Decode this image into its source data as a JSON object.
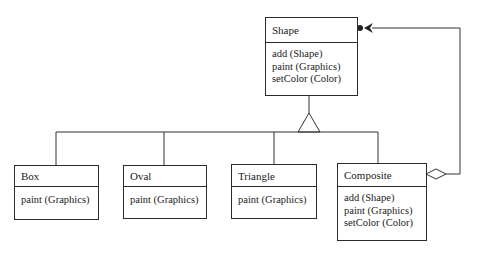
{
  "diagram": {
    "type": "UML class diagram (Composite pattern)",
    "classes": [
      {
        "id": "shape",
        "name": "Shape",
        "operations": [
          "add (Shape)",
          "paint (Graphics)",
          "setColor (Color)"
        ]
      },
      {
        "id": "box",
        "name": "Box",
        "operations": [
          "paint (Graphics)"
        ]
      },
      {
        "id": "oval",
        "name": "Oval",
        "operations": [
          "paint (Graphics)"
        ]
      },
      {
        "id": "triangle",
        "name": "Triangle",
        "operations": [
          "paint (Graphics)"
        ]
      },
      {
        "id": "composite",
        "name": "Composite",
        "operations": [
          "add (Shape)",
          "paint (Graphics)",
          "setColor (Color)"
        ]
      }
    ],
    "relationships": [
      {
        "type": "generalization",
        "from": "box",
        "to": "shape"
      },
      {
        "type": "generalization",
        "from": "oval",
        "to": "shape"
      },
      {
        "type": "generalization",
        "from": "triangle",
        "to": "shape"
      },
      {
        "type": "generalization",
        "from": "composite",
        "to": "shape"
      },
      {
        "type": "aggregation",
        "from": "composite",
        "to": "shape",
        "multiplicity_end": "many (filled dot)"
      }
    ],
    "colors": {
      "line": "#2a2a2a",
      "background": "#ffffff"
    }
  }
}
